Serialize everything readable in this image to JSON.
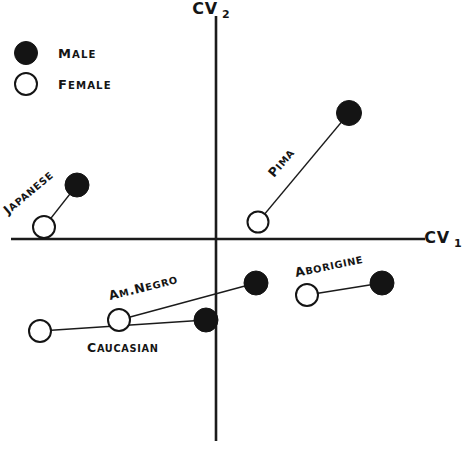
{
  "chart_data": {
    "type": "scatter",
    "title": "",
    "xlabel": "CV1",
    "ylabel": "CV2",
    "xlabel_base": "CV",
    "xlabel_sub": "1",
    "ylabel_base": "CV",
    "ylabel_sub": "2",
    "grid": false,
    "axes_style": "centered-crosshair",
    "xlim": [
      -2.6,
      2.0
    ],
    "ylim": [
      -2.2,
      2.4
    ],
    "legend": {
      "position": "top-left",
      "entries": [
        {
          "label": "Male",
          "marker": "filled-circle",
          "color": "#141414"
        },
        {
          "label": "Female",
          "marker": "open-circle",
          "color": "#ffffff"
        }
      ]
    },
    "series": [
      {
        "name": "Japanese",
        "label": "Japanese",
        "label_rotation": -40,
        "points": [
          {
            "sex": "Female",
            "marker": "open-circle",
            "cv1": -1.93,
            "cv2": 0.08
          },
          {
            "sex": "Male",
            "marker": "filled-circle",
            "cv1": -1.56,
            "cv2": 0.55
          }
        ]
      },
      {
        "name": "Pima",
        "label": "Pima",
        "label_rotation": -50,
        "points": [
          {
            "sex": "Female",
            "marker": "open-circle",
            "cv1": 0.47,
            "cv2": 0.19
          },
          {
            "sex": "Male",
            "marker": "filled-circle",
            "cv1": 1.48,
            "cv2": 1.41
          }
        ]
      },
      {
        "name": "Caucasian",
        "label": "Caucasian",
        "label_rotation": 0,
        "points": [
          {
            "sex": "Female",
            "marker": "open-circle",
            "cv1": -1.97,
            "cv2": -1.03
          },
          {
            "sex": "Male",
            "marker": "filled-circle",
            "cv1": -0.11,
            "cv2": -0.91
          }
        ]
      },
      {
        "name": "Am.Negro",
        "label": "Am.Negro",
        "label_rotation": -14,
        "points": [
          {
            "sex": "Female",
            "marker": "open-circle",
            "cv1": -1.09,
            "cv2": -0.91
          },
          {
            "sex": "Male",
            "marker": "filled-circle",
            "cv1": 0.45,
            "cv2": -0.49
          }
        ]
      },
      {
        "name": "Aborigine",
        "label": "Aborigine",
        "label_rotation": -12,
        "points": [
          {
            "sex": "Female",
            "marker": "open-circle",
            "cv1": 1.02,
            "cv2": -0.63
          },
          {
            "sex": "Male",
            "marker": "filled-circle",
            "cv1": 1.86,
            "cv2": -0.49
          }
        ]
      }
    ]
  },
  "legend": {
    "male_label": "Male",
    "female_label": "Female"
  },
  "axes": {
    "x_name": "CV",
    "x_sub": "1",
    "y_name": "CV",
    "y_sub": "2"
  },
  "labels": {
    "japanese": "Japanese",
    "pima": "Pima",
    "caucasian": "Caucasian",
    "am_negro": "Am.Negro",
    "aborigine": "Aborigine"
  }
}
